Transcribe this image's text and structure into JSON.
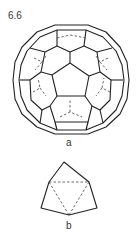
{
  "figure": {
    "number": "6.6",
    "panels": [
      {
        "label": "a",
        "description": "Truncated icosahedron (C60 fullerene) wireframe, hidden edges dashed"
      },
      {
        "label": "b",
        "description": "Pentagonal pyramid/vertex figure with dashed hidden triangle"
      }
    ]
  },
  "colors": {
    "line": "#222222",
    "background": "#ffffff"
  }
}
